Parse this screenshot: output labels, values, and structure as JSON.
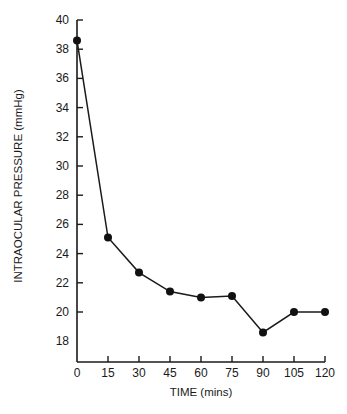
{
  "chart_data": {
    "type": "line",
    "title": "",
    "xlabel": "TIME (mins)",
    "ylabel": "INTRAOCULAR PRESSURE (mmHg)",
    "x": [
      0,
      15,
      30,
      45,
      60,
      75,
      90,
      105,
      120
    ],
    "series": [
      {
        "name": "Intraocular pressure",
        "values": [
          38.6,
          25.1,
          22.7,
          21.4,
          21.0,
          21.1,
          18.6,
          20.0,
          20.0
        ]
      }
    ],
    "xticks": [
      "0",
      "15",
      "30",
      "45",
      "60",
      "75",
      "90",
      "105",
      "120"
    ],
    "yticks": [
      "18",
      "20",
      "22",
      "24",
      "26",
      "28",
      "30",
      "32",
      "34",
      "36",
      "38",
      "40"
    ],
    "xlim": [
      0,
      120
    ],
    "ylim": [
      16.6,
      40
    ],
    "grid": false,
    "legend": "none",
    "marker": "filled-circle",
    "color": "#1a1a1a"
  }
}
